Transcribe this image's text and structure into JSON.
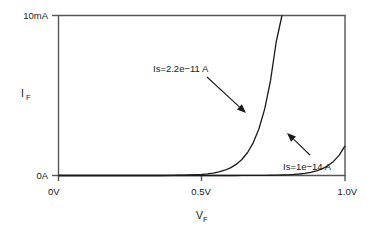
{
  "chart_data": {
    "type": "line",
    "title": "",
    "subtitle": "",
    "xlabel": "V",
    "xlabel_sub": "F",
    "ylabel": "I",
    "ylabel_sub": "F",
    "xlim": [
      0,
      1.0
    ],
    "ylim": [
      0,
      0.01
    ],
    "xunit": "V",
    "yunit": "A",
    "grid": false,
    "legend_position": "inline-annotations",
    "xticks": [
      {
        "value": 0,
        "label": "0V"
      },
      {
        "value": 0.5,
        "label": "0.5V"
      },
      {
        "value": 1.0,
        "label": "1.0V"
      }
    ],
    "yticks": [
      {
        "value": 0,
        "label": "0A"
      },
      {
        "value": 0.01,
        "label": "10mA"
      }
    ],
    "series": [
      {
        "name": "Is=2.2e-11 A",
        "saturation_current": 2.2e-11,
        "thermal_voltage": 0.02585,
        "x": [
          0.0,
          0.05,
          0.1,
          0.15,
          0.2,
          0.25,
          0.3,
          0.35,
          0.4,
          0.42,
          0.44,
          0.46,
          0.48,
          0.5,
          0.52,
          0.54,
          0.56,
          0.58,
          0.6,
          0.62,
          0.64,
          0.66,
          0.68,
          0.7,
          0.72,
          0.74,
          0.76,
          0.78,
          0.8,
          0.82,
          0.84,
          0.86,
          0.88,
          0.9,
          0.92,
          0.94,
          0.96,
          0.98,
          1.0
        ],
        "y": [
          0.0,
          0.0,
          0.0,
          0.0,
          0.0,
          0.0,
          0.0,
          0.0,
          1e-05,
          1.5e-05,
          2.2e-05,
          3.3e-05,
          4.9e-05,
          7.2e-05,
          0.000106,
          0.000155,
          0.000226,
          0.000329,
          0.000478,
          0.000692,
          0.000999,
          0.001436,
          0.002058,
          0.002939,
          0.004182,
          0.005927,
          0.00836,
          0.01,
          0.01,
          0.01,
          0.01,
          0.01,
          0.01,
          0.01,
          0.01,
          0.01,
          0.01,
          0.01,
          0.01
        ]
      },
      {
        "name": "Is=1e-14 A",
        "saturation_current": 1e-14,
        "thermal_voltage": 0.02585,
        "x": [
          0.0,
          0.05,
          0.1,
          0.15,
          0.2,
          0.25,
          0.3,
          0.35,
          0.4,
          0.45,
          0.5,
          0.55,
          0.6,
          0.62,
          0.64,
          0.66,
          0.68,
          0.7,
          0.72,
          0.74,
          0.76,
          0.78,
          0.8,
          0.82,
          0.84,
          0.86,
          0.88,
          0.9,
          0.92,
          0.94,
          0.96,
          0.98,
          1.0
        ],
        "y": [
          0.0,
          0.0,
          0.0,
          0.0,
          0.0,
          0.0,
          0.0,
          0.0,
          0.0,
          0.0,
          0.0,
          0.0,
          1e-06,
          1.5e-06,
          2.2e-06,
          3.2e-06,
          4.7e-06,
          6.8e-06,
          9.9e-06,
          1.44e-05,
          2.09e-05,
          3.04e-05,
          4.42e-05,
          6.42e-05,
          9.33e-05,
          0.0001356,
          0.000197,
          0.0002863,
          0.000416,
          0.0006045,
          0.0008785,
          0.0012766,
          0.0018551
        ]
      }
    ],
    "annotations": [
      {
        "id": "annotation-upper",
        "text": "Is=2.2e−11 A",
        "target_series": "Is=2.2e-11 A",
        "text_x": 153,
        "text_y": 72,
        "arrow_from_x": 207,
        "arrow_from_y": 77,
        "arrow_to_x": 246,
        "arrow_to_y": 113
      },
      {
        "id": "annotation-lower",
        "text": "Is=1e−14 A",
        "target_series": "Is=1e-14 A",
        "text_x": 283,
        "text_y": 170,
        "arrow_from_x": 310,
        "arrow_from_y": 155,
        "arrow_to_x": 287,
        "arrow_to_y": 133
      }
    ],
    "colors": {
      "axis": "#555555",
      "curve": "#1a1a1a",
      "text": "#1a1a1a",
      "background": "#ffffff"
    }
  },
  "axes": {
    "y_top_label": "10mA",
    "y_bottom_label": "0A",
    "x_left_label": "0V",
    "x_mid_label": "0.5V",
    "x_right_label": "1.0V",
    "y_title": "I",
    "y_title_sub": "F",
    "x_title": "V",
    "x_title_sub": "F"
  }
}
